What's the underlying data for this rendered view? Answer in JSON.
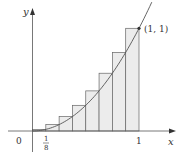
{
  "chart_data": {
    "type": "bar",
    "subtype": "riemann-sum-right-endpoints",
    "function": "y = x^2",
    "interval": [
      0,
      1
    ],
    "n_rectangles": 8,
    "x": [
      0.125,
      0.25,
      0.375,
      0.5,
      0.625,
      0.75,
      0.875,
      1.0
    ],
    "values": [
      0.015625,
      0.0625,
      0.140625,
      0.25,
      0.390625,
      0.5625,
      0.765625,
      1.0
    ],
    "title": "",
    "xlabel": "x",
    "ylabel": "y",
    "xlim": [
      0,
      1.2
    ],
    "ylim": [
      0,
      1.25
    ],
    "grid": false,
    "tick_labels": {
      "origin": "0",
      "x_tick_1_num": "1",
      "x_tick_1_den": "8",
      "x_tick_end": "1"
    },
    "annotations": [
      {
        "text": "(1, 1)",
        "x": 1,
        "y": 1
      }
    ]
  },
  "colors": {
    "axis": "#555555",
    "curve": "#555555",
    "rect_fill": "#ececec",
    "rect_stroke": "#666666",
    "point": "#333333"
  }
}
